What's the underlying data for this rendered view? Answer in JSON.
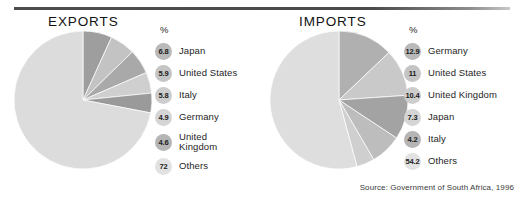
{
  "top_clipped_text": "",
  "source_note": "Source: Government of South Africa, 1996",
  "exports": {
    "title": "EXPORTS",
    "percent_header": "%",
    "legend": [
      {
        "value": "6.8",
        "label": "Japan"
      },
      {
        "value": "5.9",
        "label": "United States"
      },
      {
        "value": "5.8",
        "label": "Italy"
      },
      {
        "value": "4.9",
        "label": "Germany"
      },
      {
        "value": "4.6",
        "label": "United\nKingdom"
      },
      {
        "value": "72",
        "label": "Others"
      }
    ]
  },
  "imports": {
    "title": "IMPORTS",
    "percent_header": "%",
    "legend": [
      {
        "value": "12.9",
        "label": "Germany"
      },
      {
        "value": "11",
        "label": "United States"
      },
      {
        "value": "10.4",
        "label": "United Kingdom"
      },
      {
        "value": "7.3",
        "label": "Japan"
      },
      {
        "value": "4.2",
        "label": "Italy"
      },
      {
        "value": "54.2",
        "label": "Others"
      }
    ]
  },
  "chart_data": [
    {
      "type": "pie",
      "title": "EXPORTS",
      "unit": "%",
      "start_angle_deg": 0,
      "direction": "clockwise",
      "categories": [
        "Japan",
        "United States",
        "Italy",
        "Germany",
        "United Kingdom",
        "Others"
      ],
      "values": [
        6.8,
        5.9,
        5.8,
        4.9,
        4.6,
        72
      ],
      "colors": [
        "#9e9e9e",
        "#c3c3c3",
        "#a9a9a9",
        "#cfcfcf",
        "#9a9a9a",
        "#dcdcdc"
      ],
      "legend_position": "right",
      "grid": false
    },
    {
      "type": "pie",
      "title": "IMPORTS",
      "unit": "%",
      "start_angle_deg": 0,
      "direction": "clockwise",
      "categories": [
        "Germany",
        "United States",
        "United Kingdom",
        "Japan",
        "Italy",
        "Others"
      ],
      "values": [
        12.9,
        11,
        10.4,
        7.3,
        4.2,
        54.2
      ],
      "colors": [
        "#b0b0b0",
        "#c9c9c9",
        "#a3a3a3",
        "#bdbdbd",
        "#cfcfcf",
        "#dedede"
      ],
      "legend_position": "right",
      "grid": false
    }
  ]
}
